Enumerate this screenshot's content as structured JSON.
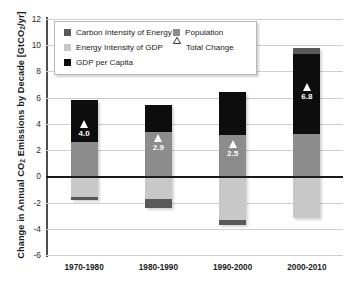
{
  "chart_data": {
    "type": "bar",
    "subtype": "stacked-bar-with-markers",
    "title": "",
    "xlabel": "",
    "ylabel": "Change in Annual CO2 Emissions by Decade [GtCO2/yr]",
    "ylabel_plain": "Change in Annual CO",
    "ylabel_sub": "2",
    "ylabel_tail": " Emissions by Decade [GtCO",
    "ylabel_tail2": "/yr]",
    "ylim": [
      -6,
      12
    ],
    "ytick_step": 2,
    "ytick_labels": [
      "12",
      "10",
      "8",
      "6",
      "4",
      "2",
      "0",
      "-2",
      "-4",
      "-6"
    ],
    "ytick_values": [
      12,
      10,
      8,
      6,
      4,
      2,
      0,
      -2,
      -4,
      -6
    ],
    "categories": [
      "1970-1980",
      "1980-1990",
      "1990-2000",
      "2000-2010"
    ],
    "grid": true,
    "legend_position": "upper-left-inside",
    "series": [
      {
        "name": "Carbon Intensity of Energy",
        "color": "#595959",
        "values": [
          -0.3,
          -0.7,
          -0.4,
          0.5
        ]
      },
      {
        "name": "Energy Intensity of GDP",
        "color": "#c8c8c8",
        "values": [
          -1.5,
          -1.1,
          -2.9,
          -3.2
        ]
      },
      {
        "name": "GDP per Capita",
        "color": "#0d0d0d",
        "values": [
          3.2,
          2.1,
          3.2,
          6.1
        ]
      },
      {
        "name": "Population",
        "color": "#8c8c8c",
        "values": [
          2.6,
          1.7,
          3.1,
          3.2
        ]
      }
    ],
    "total_change": {
      "name": "Total Change",
      "marker": "triangle",
      "color": "#ffffff",
      "labels": [
        "4.0",
        "2.9",
        "2.5",
        "6.8"
      ],
      "values": [
        4.0,
        2.9,
        2.5,
        6.8
      ]
    },
    "bars": [
      {
        "category": "1970-1980",
        "total_label": "4.0",
        "total_value": 4.0,
        "segments": [
          {
            "series": "GDP per Capita",
            "from": 2.6,
            "to": 5.85
          },
          {
            "series": "Population",
            "from": 0.0,
            "to": 2.6
          },
          {
            "series": "Energy Intensity of GDP",
            "from": -1.55,
            "to": 0.0
          },
          {
            "series": "Carbon Intensity of Energy",
            "from": -1.8,
            "to": -1.55
          }
        ]
      },
      {
        "category": "1980-1990",
        "total_label": "2.9",
        "total_value": 2.9,
        "segments": [
          {
            "series": "GDP per Capita",
            "from": 3.35,
            "to": 5.45
          },
          {
            "series": "Population",
            "from": 0.0,
            "to": 3.35
          },
          {
            "series": "Energy Intensity of GDP",
            "from": -1.75,
            "to": 0.0
          },
          {
            "series": "Carbon Intensity of Energy",
            "from": -2.45,
            "to": -1.75
          }
        ]
      },
      {
        "category": "1990-2000",
        "total_label": "2.5",
        "total_value": 2.5,
        "segments": [
          {
            "series": "GDP per Capita",
            "from": 3.15,
            "to": 6.4
          },
          {
            "series": "Population",
            "from": 0.0,
            "to": 3.15
          },
          {
            "series": "Energy Intensity of GDP",
            "from": -3.3,
            "to": 0.0
          },
          {
            "series": "Carbon Intensity of Energy",
            "from": -3.7,
            "to": -3.3
          }
        ]
      },
      {
        "category": "2000-2010",
        "total_label": "6.8",
        "total_value": 6.8,
        "segments": [
          {
            "series": "Carbon Intensity of Energy",
            "from": 9.3,
            "to": 9.8
          },
          {
            "series": "GDP per Capita",
            "from": 3.2,
            "to": 9.3
          },
          {
            "series": "Population",
            "from": 0.0,
            "to": 3.2
          },
          {
            "series": "Energy Intensity of GDP",
            "from": -3.2,
            "to": 0.0
          }
        ]
      }
    ]
  },
  "legend": {
    "items": [
      {
        "label": "Carbon Intensity of Energy",
        "color": "#595959",
        "marker": "square"
      },
      {
        "label": "Energy Intensity of GDP",
        "color": "#c8c8c8",
        "marker": "square"
      },
      {
        "label": "GDP per Capita",
        "color": "#0d0d0d",
        "marker": "square"
      },
      {
        "label": "Population",
        "color": "#8c8c8c",
        "marker": "square"
      },
      {
        "label": "Total Change",
        "color": "#ffffff",
        "marker": "triangle"
      }
    ]
  }
}
